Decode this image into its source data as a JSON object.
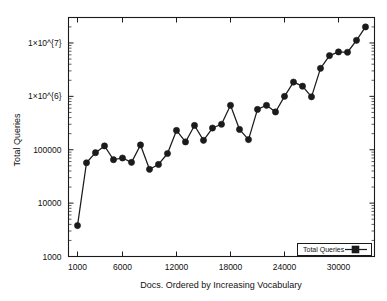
{
  "chart_data": {
    "type": "line",
    "title": "",
    "xlabel": "Docs. Ordered by Increasing Vocabulary",
    "ylabel": "Total Queries",
    "yscale": "log",
    "xlim": [
      0,
      34000
    ],
    "ylim": [
      1000,
      30000000
    ],
    "grid": false,
    "legend_position": "bottom-right",
    "xticks": [
      1000,
      6000,
      12000,
      18000,
      24000,
      30000
    ],
    "xtick_labels": [
      "1000",
      "6000",
      "12000",
      "18000",
      "24000",
      "30000"
    ],
    "yticks": [
      1000,
      10000,
      100000,
      1000000,
      10000000
    ],
    "ytick_labels": [
      "1000",
      "10000",
      "100000",
      "1×10^{6}",
      "1×10^{7}"
    ],
    "series": [
      {
        "name": "Total Queries",
        "marker": "filled-circle",
        "x": [
          1000,
          2000,
          3000,
          4000,
          5000,
          6000,
          7000,
          8000,
          9000,
          10000,
          11000,
          12000,
          13000,
          14000,
          15000,
          16000,
          17000,
          18000,
          19000,
          20000,
          21000,
          22000,
          23000,
          24000,
          25000,
          26000,
          27000,
          28000,
          29000,
          30000,
          31000,
          32000,
          33000
        ],
        "values": [
          3800,
          57000,
          88000,
          118000,
          65000,
          70000,
          58000,
          123000,
          43000,
          53000,
          85000,
          230000,
          140000,
          285000,
          150000,
          255000,
          300000,
          680000,
          240000,
          155000,
          570000,
          680000,
          510000,
          1000000,
          1850000,
          1550000,
          980000,
          3350000,
          5800000,
          6800000,
          6700000,
          11200000,
          20000000
        ]
      }
    ]
  },
  "legend": {
    "entries": [
      {
        "label": "Total Queries"
      }
    ]
  },
  "axes": {
    "x_title": "Docs. Ordered by Increasing Vocabulary",
    "y_title": "Total Queries"
  }
}
